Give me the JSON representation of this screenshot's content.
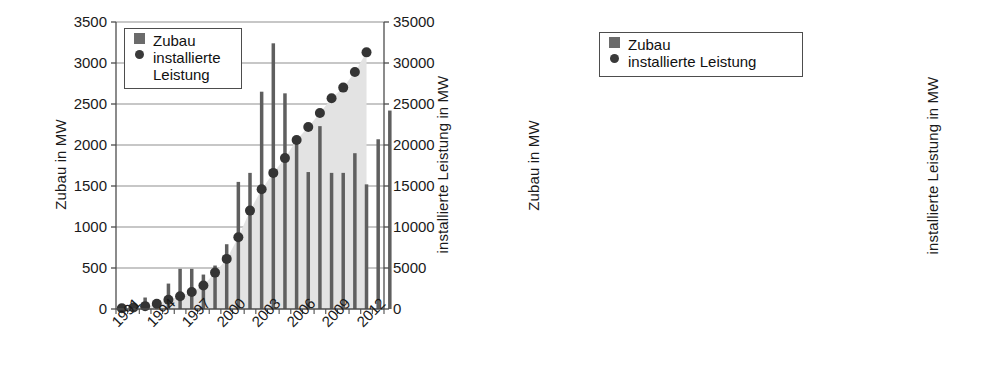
{
  "colors": {
    "bar": "#5f5f5f",
    "bar_dark": "#4a4a4a",
    "area": "#e3e3e3",
    "dot": "#343434",
    "grid": "#8f8f8f",
    "axis": "#4d4d4d",
    "text": "#111111"
  },
  "legend": {
    "bar_label": "Zubau",
    "dot_label_line1": "installierte",
    "dot_label_line2": "Leistung",
    "dot_label_single": "installierte Leistung"
  },
  "chart_data": [
    {
      "id": "left",
      "type": "bar",
      "title": "",
      "xlabel": "",
      "ylabel": "Zubau in MW",
      "y2label": "installierte Leistung in MW",
      "ylim": [
        0,
        3500
      ],
      "y2lim": [
        0,
        35000
      ],
      "yticks": [
        0,
        500,
        1000,
        1500,
        2000,
        2500,
        3000,
        3500
      ],
      "y2ticks": [
        0,
        5000,
        10000,
        15000,
        20000,
        25000,
        30000,
        35000
      ],
      "ytick_labels": [
        "0",
        "500",
        "1000",
        "1500",
        "2000",
        "2500",
        "3000",
        "3500"
      ],
      "y2tick_labels": [
        "0",
        "5000",
        "10000",
        "15000",
        "20000",
        "25000",
        "30000",
        "35000"
      ],
      "grid": true,
      "legend_position": "upper-left",
      "categories": [
        "1991",
        "1992",
        "1993",
        "1994",
        "1995",
        "1996",
        "1997",
        "1998",
        "1999",
        "2000",
        "2001",
        "2002",
        "2003",
        "2004",
        "2005",
        "2006",
        "2007",
        "2008",
        "2009",
        "2010",
        "2011",
        "2012",
        "2013"
      ],
      "xtick_labels": [
        "1991",
        "1994",
        "1997",
        "2000",
        "2003",
        "2006",
        "2009",
        "2012"
      ],
      "xtick_indices": [
        0,
        3,
        6,
        9,
        12,
        15,
        18,
        21
      ],
      "series": [
        {
          "name": "Zubau",
          "axis": "left",
          "unit": "MW",
          "values": [
            20,
            40,
            140,
            90,
            310,
            490,
            490,
            420,
            530,
            790,
            1550,
            1660,
            2650,
            3240,
            2630,
            2020,
            1670,
            2230,
            1660,
            1660,
            1900,
            1520,
            2070,
            2420
          ]
        },
        {
          "name": "installierte Leistung",
          "axis": "right",
          "unit": "MW",
          "values": [
            100,
            180,
            350,
            640,
            1130,
            1550,
            2080,
            2870,
            4440,
            6110,
            8750,
            12000,
            14600,
            16600,
            18400,
            20600,
            22200,
            23900,
            25700,
            27000,
            28900,
            31300
          ]
        }
      ]
    },
    {
      "id": "right",
      "type": "bar",
      "title": "",
      "xlabel": "",
      "ylabel": "Zubau in MW",
      "y2label": "installierte Leistung in MW",
      "ylim": [
        0,
        9000
      ],
      "y2lim": [
        0,
        35000
      ],
      "yticks": [
        0,
        1000,
        2000,
        3000,
        4000,
        5000,
        6000,
        7000,
        8000,
        9000
      ],
      "y2ticks": [
        0,
        5000,
        10000,
        15000,
        20000,
        25000,
        30000,
        35000
      ],
      "ytick_labels": [
        "0",
        "1000",
        "2000",
        "3000",
        "4000",
        "5000",
        "6000",
        "7000",
        "8000",
        "9000"
      ],
      "y2tick_labels": [
        "0",
        "5000",
        "10000",
        "15000",
        "20000",
        "25000",
        "30000",
        "35000"
      ],
      "grid": true,
      "legend_position": "upper-left",
      "categories": [
        "2000",
        "2001",
        "2002",
        "2003",
        "2004",
        "2005",
        "2006",
        "2007",
        "2008",
        "2009",
        "2010",
        "2011",
        "2012"
      ],
      "xtick_labels": [
        "2000",
        "2002",
        "2004",
        "2006",
        "2008",
        "2010",
        "2012"
      ],
      "xtick_indices": [
        0,
        2,
        4,
        6,
        8,
        10,
        12
      ],
      "series": [
        {
          "name": "Zubau",
          "axis": "left",
          "unit": "MW",
          "values": [
            20,
            40,
            80,
            150,
            620,
            900,
            720,
            1190,
            1720,
            3710,
            7330,
            7430,
            7560
          ]
        },
        {
          "name": "installierte Leistung",
          "axis": "right",
          "unit": "MW",
          "values": [
            110,
            180,
            300,
            450,
            1100,
            2000,
            2800,
            4200,
            6100,
            9900,
            17300,
            25000,
            32600
          ]
        }
      ]
    }
  ]
}
